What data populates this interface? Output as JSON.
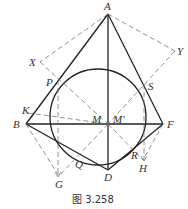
{
  "caption": "图 3.258",
  "points": {
    "A": {
      "label": "A",
      "x": 108,
      "y": 14
    },
    "X": {
      "label": "X",
      "x": 40,
      "y": 62
    },
    "Y": {
      "label": "Y",
      "x": 175,
      "y": 51
    },
    "P": {
      "label": "P",
      "x": 58,
      "y": 80
    },
    "S": {
      "label": "S",
      "x": 144,
      "y": 84
    },
    "K": {
      "label": "K",
      "x": 32,
      "y": 112
    },
    "B": {
      "label": "B",
      "x": 26,
      "y": 124
    },
    "M": {
      "label": "M",
      "x": 108,
      "y": 124
    },
    "M_prime": {
      "label": "M'",
      "x": 108,
      "y": 124
    },
    "F": {
      "label": "F",
      "x": 163,
      "y": 124
    },
    "Q": {
      "label": "Q",
      "x": 78,
      "y": 162
    },
    "R": {
      "label": "R",
      "x": 140,
      "y": 155
    },
    "H": {
      "label": "H",
      "x": 143,
      "y": 163
    },
    "D": {
      "label": "D",
      "x": 108,
      "y": 170
    },
    "G": {
      "label": "G",
      "x": 59,
      "y": 178
    }
  },
  "circle": {
    "cx": 98,
    "cy": 117,
    "r": 48
  },
  "colors": {
    "line": "#222222",
    "dashed": "#777777",
    "text": "#333333"
  }
}
